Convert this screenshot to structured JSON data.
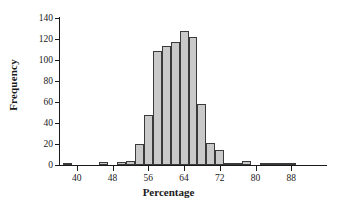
{
  "chart_data": {
    "type": "bar",
    "title": "",
    "subtitle": "",
    "xlabel": "Percentage",
    "ylabel": "Frequency",
    "xlim": [
      36,
      96
    ],
    "ylim": [
      0,
      140
    ],
    "xticks": [
      40,
      48,
      56,
      64,
      72,
      80,
      88
    ],
    "yticks": [
      0,
      20,
      40,
      60,
      80,
      100,
      120,
      140
    ],
    "grid": false,
    "legend": null,
    "bin_width": 2,
    "bar_color": "#c9c9c9",
    "bar_edge_color": "#3a3a3a",
    "axis_color": "#1a1a1a",
    "background_color": "#ffffff",
    "bins": [
      {
        "x0": 37,
        "x1": 39,
        "center": 38,
        "value": 2
      },
      {
        "x0": 39,
        "x1": 41,
        "center": 40,
        "value": 0
      },
      {
        "x0": 41,
        "x1": 43,
        "center": 42,
        "value": 0
      },
      {
        "x0": 43,
        "x1": 45,
        "center": 44,
        "value": 0
      },
      {
        "x0": 45,
        "x1": 47,
        "center": 46,
        "value": 3
      },
      {
        "x0": 47,
        "x1": 49,
        "center": 48,
        "value": 0
      },
      {
        "x0": 49,
        "x1": 51,
        "center": 50,
        "value": 3
      },
      {
        "x0": 51,
        "x1": 53,
        "center": 52,
        "value": 4
      },
      {
        "x0": 53,
        "x1": 55,
        "center": 54,
        "value": 20
      },
      {
        "x0": 55,
        "x1": 57,
        "center": 56,
        "value": 48
      },
      {
        "x0": 57,
        "x1": 59,
        "center": 58,
        "value": 109
      },
      {
        "x0": 59,
        "x1": 61,
        "center": 60,
        "value": 113
      },
      {
        "x0": 61,
        "x1": 63,
        "center": 62,
        "value": 117
      },
      {
        "x0": 63,
        "x1": 65,
        "center": 64,
        "value": 128
      },
      {
        "x0": 65,
        "x1": 67,
        "center": 66,
        "value": 122
      },
      {
        "x0": 67,
        "x1": 69,
        "center": 68,
        "value": 58
      },
      {
        "x0": 69,
        "x1": 71,
        "center": 70,
        "value": 21
      },
      {
        "x0": 71,
        "x1": 73,
        "center": 72,
        "value": 14
      },
      {
        "x0": 73,
        "x1": 75,
        "center": 74,
        "value": 1
      },
      {
        "x0": 75,
        "x1": 77,
        "center": 76,
        "value": 1
      },
      {
        "x0": 77,
        "x1": 79,
        "center": 78,
        "value": 4
      },
      {
        "x0": 79,
        "x1": 81,
        "center": 80,
        "value": 0
      },
      {
        "x0": 81,
        "x1": 83,
        "center": 82,
        "value": 1
      },
      {
        "x0": 83,
        "x1": 85,
        "center": 84,
        "value": 2
      },
      {
        "x0": 85,
        "x1": 87,
        "center": 86,
        "value": 2
      },
      {
        "x0": 87,
        "x1": 89,
        "center": 88,
        "value": 1
      },
      {
        "x0": 89,
        "x1": 91,
        "center": 90,
        "value": 0
      },
      {
        "x0": 91,
        "x1": 93,
        "center": 92,
        "value": 0
      },
      {
        "x0": 93,
        "x1": 95,
        "center": 94,
        "value": 0
      }
    ]
  }
}
